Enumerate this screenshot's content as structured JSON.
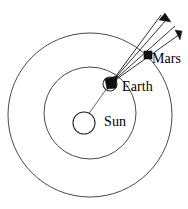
{
  "diagram": {
    "type": "orbital-diagram",
    "canvas": {
      "width": 188,
      "height": 209,
      "background": "#ffffff"
    },
    "colors": {
      "orbit_stroke": "#4a4a4a",
      "body_stroke": "#2b2b2b",
      "body_fill": "#111111",
      "ray_stroke": "#1a1a1a",
      "label_color": "#000000"
    },
    "labels": {
      "sun": "Sun",
      "earth": "Earth",
      "mars": "Mars"
    },
    "bodies": [
      {
        "name": "Sun",
        "cx": 84,
        "cy": 123,
        "r": 11,
        "style": "outline"
      },
      {
        "name": "Earth",
        "cx": 110,
        "cy": 84,
        "r": 7,
        "style": "outline-half-filled"
      },
      {
        "name": "Mars",
        "cx": 148,
        "cy": 55,
        "r": 4.5,
        "style": "filled"
      }
    ],
    "orbits": [
      {
        "name": "inner-orbit-earth",
        "cx": 90,
        "cy": 113,
        "r": 46
      },
      {
        "name": "outer-orbit-mars",
        "cx": 90,
        "cy": 115,
        "r": 82
      }
    ],
    "rays": [
      {
        "name": "sight-ray-1",
        "x1": 110,
        "y1": 84,
        "x2": 168,
        "y2": 18,
        "arrow": true
      },
      {
        "name": "sight-ray-2",
        "x1": 110,
        "y1": 84,
        "x2": 180,
        "y2": 32,
        "arrow": true
      },
      {
        "name": "sight-ray-3",
        "x1": 110,
        "y1": 84,
        "x2": 160,
        "y2": 14,
        "arrow": false
      },
      {
        "name": "sight-ray-4",
        "x1": 110,
        "y1": 84,
        "x2": 174,
        "y2": 24,
        "arrow": false
      }
    ],
    "radius_line": {
      "name": "sun-earth-radius",
      "x1": 80,
      "y1": 127,
      "x2": 112,
      "y2": 82
    }
  }
}
